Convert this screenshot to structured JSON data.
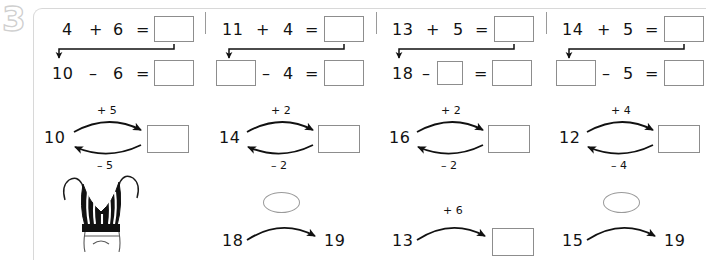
{
  "worksheet": {
    "exercise_number": "3",
    "illustration_name": "striped-mittens-drawing"
  },
  "columns": [
    {
      "id": "col-1",
      "chain": {
        "add_row": {
          "a": "4",
          "plus": "+",
          "b": "6",
          "equals": "=",
          "result_box": ""
        },
        "sub_row": {
          "a": "10",
          "minus": "–",
          "b": "6",
          "equals": "=",
          "result_box": ""
        }
      },
      "loop": {
        "start": "10",
        "forward_label": "+ 5",
        "back_label": "– 5",
        "end_box": ""
      },
      "bottom": {
        "kind": "illustration"
      }
    },
    {
      "id": "col-2",
      "chain": {
        "add_row": {
          "a": "11",
          "plus": "+",
          "b": "4",
          "equals": "=",
          "result_box": ""
        },
        "sub_row": {
          "a": "",
          "minus": "–",
          "b": "4",
          "equals": "=",
          "result_box": ""
        }
      },
      "loop": {
        "start": "14",
        "forward_label": "+ 2",
        "back_label": "– 2",
        "end_box": ""
      },
      "bottom": {
        "kind": "arrow-pair",
        "start": "18",
        "end": "19",
        "oval_label": ""
      }
    },
    {
      "id": "col-3",
      "chain": {
        "add_row": {
          "a": "13",
          "plus": "+",
          "b": "5",
          "equals": "=",
          "result_box": ""
        },
        "sub_row": {
          "a": "18",
          "minus": "–",
          "b": "",
          "equals": "=",
          "result_box": ""
        }
      },
      "loop": {
        "start": "16",
        "forward_label": "+ 2",
        "back_label": "– 2",
        "end_box": ""
      },
      "bottom": {
        "kind": "arrow-box",
        "start": "13",
        "forward_label": "+ 6",
        "end_box": ""
      }
    },
    {
      "id": "col-4",
      "chain": {
        "add_row": {
          "a": "14",
          "plus": "+",
          "b": "5",
          "equals": "=",
          "result_box": ""
        },
        "sub_row": {
          "a": "",
          "minus": "–",
          "b": "5",
          "equals": "=",
          "result_box": ""
        }
      },
      "loop": {
        "start": "12",
        "forward_label": "+ 4",
        "back_label": "– 4",
        "end_box": ""
      },
      "bottom": {
        "kind": "arrow-pair",
        "start": "15",
        "end": "19",
        "oval_label": ""
      }
    }
  ],
  "colors": {
    "card_border": "#d8d8d8",
    "box_border": "#8d8d8d",
    "divider": "#9a9a9a",
    "ink": "#121212",
    "watermark": "#cfcfcf"
  }
}
